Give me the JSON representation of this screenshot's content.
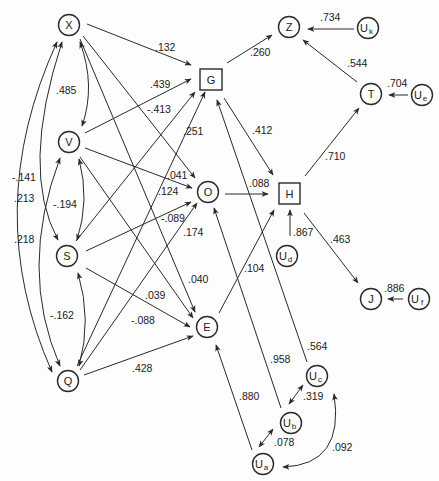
{
  "diagram": {
    "type": "path-diagram",
    "nodes": [
      {
        "id": "X",
        "label": "X",
        "shape": "circle",
        "x": 69,
        "y": 25
      },
      {
        "id": "V",
        "label": "V",
        "shape": "circle",
        "x": 69,
        "y": 142
      },
      {
        "id": "S",
        "label": "S",
        "shape": "circle",
        "x": 67,
        "y": 256
      },
      {
        "id": "Q",
        "label": "Q",
        "shape": "circle",
        "x": 68,
        "y": 381
      },
      {
        "id": "G",
        "label": "G",
        "shape": "square",
        "x": 211,
        "y": 79
      },
      {
        "id": "O",
        "label": "O",
        "shape": "circle",
        "x": 208,
        "y": 190
      },
      {
        "id": "E",
        "label": "E",
        "shape": "circle",
        "x": 207,
        "y": 327
      },
      {
        "id": "H",
        "label": "H",
        "shape": "square",
        "x": 287,
        "y": 189
      },
      {
        "id": "Z",
        "label": "Z",
        "shape": "circle",
        "x": 289,
        "y": 27
      },
      {
        "id": "Uk",
        "label": "U",
        "sub": "k",
        "shape": "circle",
        "x": 368,
        "y": 28
      },
      {
        "id": "T",
        "label": "T",
        "shape": "circle",
        "x": 371,
        "y": 93
      },
      {
        "id": "Ue",
        "label": "U",
        "sub": "e",
        "shape": "circle",
        "x": 422,
        "y": 95
      },
      {
        "id": "Ud",
        "label": "U",
        "sub": "d",
        "shape": "circle",
        "x": 287,
        "y": 256
      },
      {
        "id": "J",
        "label": "J",
        "shape": "circle",
        "x": 371,
        "y": 298
      },
      {
        "id": "Uf",
        "label": "U",
        "sub": "f",
        "shape": "circle",
        "x": 419,
        "y": 298
      },
      {
        "id": "Uc",
        "label": "U",
        "sub": "c",
        "shape": "circle",
        "x": 317,
        "y": 376
      },
      {
        "id": "Ub",
        "label": "U",
        "sub": "b",
        "shape": "circle",
        "x": 291,
        "y": 423
      },
      {
        "id": "Ua",
        "label": "U",
        "sub": "a",
        "shape": "circle",
        "x": 263,
        "y": 464
      }
    ],
    "paths": [
      {
        "from": "X",
        "to": "G",
        "coef": ".132",
        "lx": 166,
        "ly": 50
      },
      {
        "from": "V",
        "to": "G",
        "coef": ".439",
        "lx": 156,
        "ly": 87
      },
      {
        "from": "X",
        "to": "O",
        "coef": "-.413",
        "lx": 156,
        "ly": 113
      },
      {
        "from": "Q",
        "to": "G",
        "coef": ".251",
        "lx": 182,
        "ly": 134
      },
      {
        "from": "S",
        "to": "G",
        "coef": "",
        "lx": 0,
        "ly": 0
      },
      {
        "from": "V",
        "to": "O",
        "coef": ".041",
        "lx": 167,
        "ly": 178
      },
      {
        "from": "X",
        "to": "E",
        "coef": ".124",
        "lx": 159,
        "ly": 195
      },
      {
        "from": "S",
        "to": "O",
        "coef": "-.089",
        "lx": 163,
        "ly": 222
      },
      {
        "from": "Q",
        "to": "O",
        "coef": ".174",
        "lx": 183,
        "ly": 236
      },
      {
        "from": "V",
        "to": "E",
        "coef": ".040",
        "lx": 189,
        "ly": 283
      },
      {
        "from": "S",
        "to": "E",
        "coef": ".039",
        "lx": 145,
        "ly": 299
      },
      {
        "from": "Q",
        "to": "E",
        "coef": "-.088",
        "lx": 131,
        "ly": 324
      },
      {
        "from": "Q",
        "to": "E2",
        "coef": ".428",
        "lx": 132,
        "ly": 372
      },
      {
        "from": "G",
        "to": "Z",
        "coef": ".260",
        "lx": 250,
        "ly": 56
      },
      {
        "from": "Uk",
        "to": "Z",
        "coef": ".734",
        "lx": 320,
        "ly": 21
      },
      {
        "from": "T",
        "to": "Z",
        "coef": ".544",
        "lx": 347,
        "ly": 67
      },
      {
        "from": "Ue",
        "to": "T",
        "coef": ".704",
        "lx": 388,
        "ly": 87
      },
      {
        "from": "G",
        "to": "H",
        "coef": ".412",
        "lx": 252,
        "ly": 134
      },
      {
        "from": "H",
        "to": "T",
        "coef": ".710",
        "lx": 325,
        "ly": 161
      },
      {
        "from": "O",
        "to": "H",
        "coef": ".088",
        "lx": 249,
        "ly": 187
      },
      {
        "from": "Ud",
        "to": "H",
        "coef": ".867",
        "lx": 293,
        "ly": 236
      },
      {
        "from": "H",
        "to": "J",
        "coef": ".463",
        "lx": 330,
        "ly": 243
      },
      {
        "from": "Uf",
        "to": "J",
        "coef": ".886",
        "lx": 385,
        "ly": 292
      },
      {
        "from": "E",
        "to": "H",
        "coef": ".104",
        "lx": 244,
        "ly": 273
      },
      {
        "from": "Uc",
        "to": "G",
        "coef": ".564",
        "lx": 308,
        "ly": 350
      },
      {
        "from": "Ub",
        "to": "O",
        "coef": ".958",
        "lx": 270,
        "ly": 363
      },
      {
        "from": "Ua",
        "to": "E",
        "coef": ".880",
        "lx": 239,
        "ly": 400
      }
    ],
    "correlations": [
      {
        "a": "X",
        "b": "V",
        "coef": ".485",
        "lx": 56,
        "ly": 94
      },
      {
        "a": "X",
        "b": "Q",
        "coef": "-.141",
        "lx": 14,
        "ly": 181
      },
      {
        "a": "X",
        "b": "S",
        "coef": ".213",
        "lx": 16,
        "ly": 202
      },
      {
        "a": "V",
        "b": "Q",
        "coef": ".218",
        "lx": 16,
        "ly": 243
      },
      {
        "a": "V",
        "b": "S",
        "coef": "-.194",
        "lx": 54,
        "ly": 208
      },
      {
        "a": "S",
        "b": "Q",
        "coef": "-.162",
        "lx": 51,
        "ly": 319
      },
      {
        "a": "Ub",
        "b": "Uc",
        "coef": ".319",
        "lx": 304,
        "ly": 400
      },
      {
        "a": "Ua",
        "b": "Ub",
        "coef": ".078",
        "lx": 274,
        "ly": 446
      },
      {
        "a": "Ua",
        "b": "Uc",
        "coef": ".092",
        "lx": 332,
        "ly": 451
      }
    ]
  }
}
